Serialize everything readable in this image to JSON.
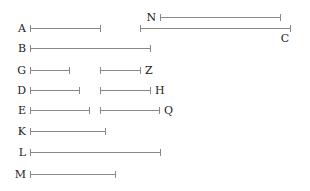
{
  "diagram": {
    "type": "labeled-interval-segments",
    "segments": [
      {
        "name": "A",
        "start": 30,
        "end": 100,
        "row": 1,
        "label_side": "left"
      },
      {
        "name": "N",
        "start": 160,
        "end": 280,
        "row": 0,
        "label_side": "left"
      },
      {
        "name": "C",
        "start": 140,
        "end": 290,
        "row": 1,
        "label_side": "below-right"
      },
      {
        "name": "B",
        "start": 30,
        "end": 150,
        "row": 2,
        "label_side": "left"
      },
      {
        "name": "G",
        "start": 30,
        "end": 69,
        "row": 3,
        "label_side": "left"
      },
      {
        "name": "Z",
        "start": 100,
        "end": 140,
        "row": 3,
        "label_side": "right"
      },
      {
        "name": "D",
        "start": 30,
        "end": 79,
        "row": 4,
        "label_side": "left"
      },
      {
        "name": "H",
        "start": 100,
        "end": 150,
        "row": 4,
        "label_side": "right"
      },
      {
        "name": "E",
        "start": 30,
        "end": 89,
        "row": 5,
        "label_side": "left"
      },
      {
        "name": "Q",
        "start": 100,
        "end": 159,
        "row": 5,
        "label_side": "right"
      },
      {
        "name": "K",
        "start": 30,
        "end": 105,
        "row": 6,
        "label_side": "left"
      },
      {
        "name": "L",
        "start": 30,
        "end": 160,
        "row": 7,
        "label_side": "left"
      },
      {
        "name": "M",
        "start": 30,
        "end": 115,
        "row": 8,
        "label_side": "left"
      }
    ]
  }
}
